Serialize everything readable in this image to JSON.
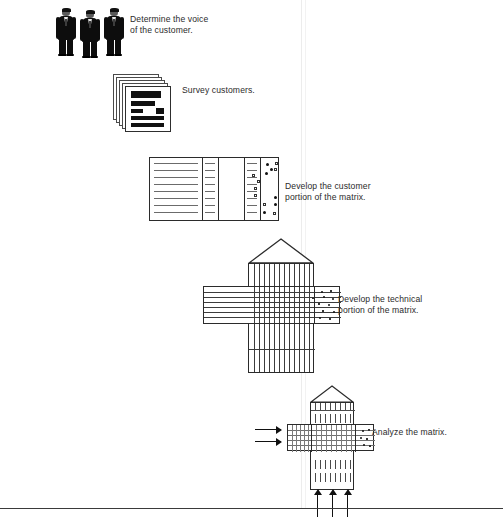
{
  "page": {
    "width": 503,
    "height": 520,
    "background": "#ffffff",
    "ink": "#1a1a1a"
  },
  "steps": [
    {
      "id": "step-1",
      "icon": "businessmen-icon",
      "caption": "Determine the voice\nof the customer.",
      "caption_x": 130,
      "caption_y": 14
    },
    {
      "id": "step-2",
      "icon": "survey-documents-icon",
      "caption": "Survey customers.",
      "caption_x": 182,
      "caption_y": 85
    },
    {
      "id": "step-3",
      "icon": "customer-matrix-icon",
      "caption": "Develop the customer\nportion of the matrix.",
      "caption_x": 285,
      "caption_y": 181
    },
    {
      "id": "step-4",
      "icon": "house-of-quality-icon",
      "caption": "Develop the technical\nportion of the matrix.",
      "caption_x": 338,
      "caption_y": 294
    },
    {
      "id": "step-5",
      "icon": "analyze-matrix-icon",
      "caption": "Analyze the matrix.",
      "caption_x": 372,
      "caption_y": 427
    }
  ],
  "colors": {
    "ink": "#1a1a1a",
    "line": "#2b2b2b",
    "rule_light": "#6b6b6b",
    "fold": "#ececec",
    "suit": "#0d0d0d",
    "paper": "#ffffff"
  },
  "marks": {
    "customer_matrix": {
      "filled_circles": [
        [
          10,
          5
        ],
        [
          18,
          10
        ],
        [
          26,
          5
        ],
        [
          14,
          17
        ],
        [
          22,
          14
        ],
        [
          30,
          38
        ],
        [
          16,
          50
        ],
        [
          30,
          48
        ]
      ],
      "open_squares": [
        [
          30,
          4
        ],
        [
          24,
          10
        ],
        [
          2,
          20
        ],
        [
          9,
          26
        ],
        [
          4,
          33
        ],
        [
          4,
          41
        ],
        [
          18,
          45
        ],
        [
          31,
          54
        ],
        [
          12,
          55
        ]
      ]
    }
  },
  "arrows": {
    "left_into_analyze": 2,
    "bottom_into_analyze": 3
  },
  "rules": {
    "bottom_rule_y": 508,
    "fold_x_primary": 301,
    "fold_x_secondary": 305
  }
}
